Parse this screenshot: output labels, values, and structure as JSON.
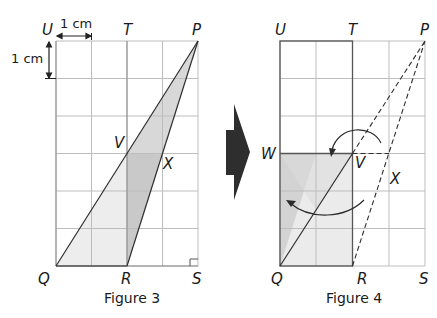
{
  "figures": [
    {
      "caption": "Figure 3",
      "labels": {
        "U": "U",
        "T": "T",
        "P": "P",
        "Q": "Q",
        "R": "R",
        "S": "S",
        "V": "V",
        "X": "X"
      },
      "scale": {
        "horizontal": "1 cm",
        "vertical": "1 cm"
      },
      "grid": {
        "columns": 4,
        "rows": 6
      }
    },
    {
      "caption": "Figure 4",
      "labels": {
        "U": "U",
        "T": "T",
        "P": "P",
        "Q": "Q",
        "R": "R",
        "S": "S",
        "V": "V",
        "X": "X",
        "W": "W"
      },
      "grid": {
        "columns": 4,
        "rows": 6
      }
    }
  ],
  "colors": {
    "grid": "#b8b8b8",
    "outline": "#3a3a3a",
    "shade_light": "#ececec",
    "shade_mid": "#d9d9d9",
    "shade_dark": "#c6c6c6",
    "arrow": "#2b2b2b"
  }
}
